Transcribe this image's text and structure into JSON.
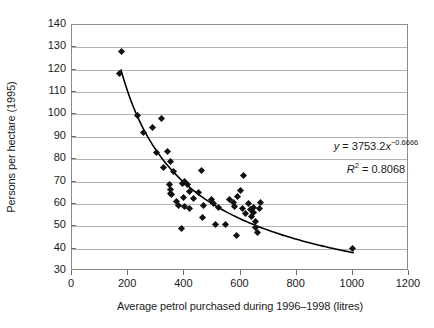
{
  "chart_data": {
    "type": "scatter",
    "title": "",
    "xlabel": "Average petrol purchased during 1996–1998 (litres)",
    "ylabel": "Persons per hectare (1995)",
    "xlim": [
      0,
      1200
    ],
    "ylim": [
      30,
      140
    ],
    "xticks": [
      0,
      200,
      400,
      600,
      800,
      1000,
      1200
    ],
    "yticks": [
      30,
      40,
      50,
      60,
      70,
      80,
      90,
      100,
      110,
      120,
      130,
      140
    ],
    "grid": "horizontal",
    "legend": "none",
    "marker": "diamond",
    "marker_color": "#111111",
    "gridline_color": "#b3b3b3",
    "frame_color": "#8c8c8c",
    "annotation": {
      "equation_y": "y",
      "equation_eq": " = 3753.2",
      "equation_x": "x",
      "equation_exp": "−0.6666",
      "r2_symbol": "R",
      "r2_sup": "2",
      "r2_value": " = 0.8068",
      "equation_full": "y = 3753.2x^-0.6666",
      "r2_full": "R2 = 0.8068"
    },
    "trendline": {
      "type": "power",
      "coefficient": 3753.2,
      "exponent": -0.6666,
      "r_squared": 0.8068,
      "x_start": 175,
      "x_end": 1010
    },
    "points": [
      [
        178,
        128.2
      ],
      [
        170,
        118.4
      ],
      [
        232,
        99.6
      ],
      [
        255,
        92.0
      ],
      [
        288,
        94.3
      ],
      [
        320,
        98.2
      ],
      [
        300,
        83.0
      ],
      [
        340,
        83.5
      ],
      [
        325,
        76.5
      ],
      [
        352,
        79.0
      ],
      [
        360,
        74.3
      ],
      [
        348,
        68.5
      ],
      [
        352,
        66.5
      ],
      [
        356,
        64.2
      ],
      [
        350,
        64.8
      ],
      [
        392,
        69.3
      ],
      [
        400,
        70.0
      ],
      [
        410,
        68.7
      ],
      [
        398,
        63.0
      ],
      [
        418,
        65.5
      ],
      [
        372,
        61.0
      ],
      [
        380,
        59.5
      ],
      [
        400,
        59.0
      ],
      [
        432,
        62.5
      ],
      [
        420,
        58.0
      ],
      [
        462,
        75.0
      ],
      [
        452,
        65.0
      ],
      [
        470,
        59.5
      ],
      [
        463,
        54.0
      ],
      [
        390,
        48.8
      ],
      [
        498,
        62.0
      ],
      [
        505,
        60.0
      ],
      [
        522,
        58.5
      ],
      [
        512,
        51.0
      ],
      [
        560,
        62.0
      ],
      [
        575,
        60.8
      ],
      [
        578,
        59.0
      ],
      [
        590,
        63.5
      ],
      [
        600,
        66.0
      ],
      [
        612,
        72.5
      ],
      [
        608,
        58.0
      ],
      [
        618,
        55.5
      ],
      [
        628,
        60.2
      ],
      [
        635,
        57.5
      ],
      [
        640,
        54.5
      ],
      [
        645,
        58.5
      ],
      [
        648,
        56.0
      ],
      [
        652,
        52.0
      ],
      [
        655,
        49.5
      ],
      [
        660,
        47.0
      ],
      [
        668,
        58.0
      ],
      [
        672,
        60.5
      ],
      [
        548,
        51.0
      ],
      [
        585,
        45.8
      ],
      [
        998,
        40.0
      ]
    ]
  }
}
